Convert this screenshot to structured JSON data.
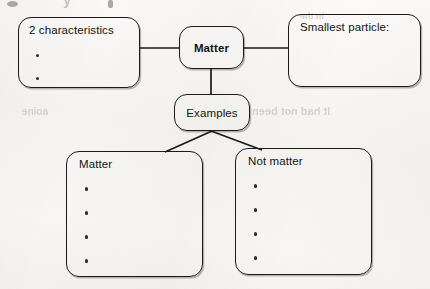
{
  "page": {
    "background_color": "#f6f5f3",
    "ink_color": "#1a1a1a",
    "header_fragment": "y"
  },
  "diagram": {
    "nodes": {
      "center": {
        "label": "Matter",
        "bold": true,
        "x": 179,
        "y": 26,
        "w": 65,
        "h": 43
      },
      "characteristics": {
        "label": "2 characteristics",
        "x": 18,
        "y": 17,
        "w": 122,
        "h": 71,
        "bullets": [
          "",
          ""
        ]
      },
      "smallest_particle": {
        "label": "Smallest particle:",
        "x": 288,
        "y": 14,
        "w": 133,
        "h": 73,
        "bullets": []
      },
      "examples": {
        "label": "Examples",
        "x": 174,
        "y": 94,
        "w": 76,
        "h": 37
      },
      "matter_list": {
        "label": "Matter",
        "x": 66,
        "y": 151,
        "w": 137,
        "h": 126,
        "bullets": [
          "",
          "",
          "",
          ""
        ]
      },
      "not_matter_list": {
        "label": "Not matter",
        "x": 235,
        "y": 148,
        "w": 137,
        "h": 127,
        "bullets": [
          "",
          "",
          "",
          ""
        ]
      }
    },
    "connectors": [
      {
        "name": "characteristics-to-matter",
        "from": "characteristics",
        "to": "center",
        "path": "M 140 48 L 179 48"
      },
      {
        "name": "matter-to-smallest-particle",
        "from": "center",
        "to": "smallest_particle",
        "path": "M 244 48 L 288 48"
      },
      {
        "name": "matter-to-examples",
        "from": "center",
        "to": "examples",
        "path": "M 211 69 L 211 95"
      },
      {
        "name": "examples-to-matter-list",
        "from": "examples",
        "to": "matter_list",
        "path": "M 211 131 L 166 152"
      },
      {
        "name": "examples-to-not-matter-list",
        "from": "examples",
        "to": "not_matter_list",
        "path": "M 211 131 L 261 150"
      }
    ]
  }
}
